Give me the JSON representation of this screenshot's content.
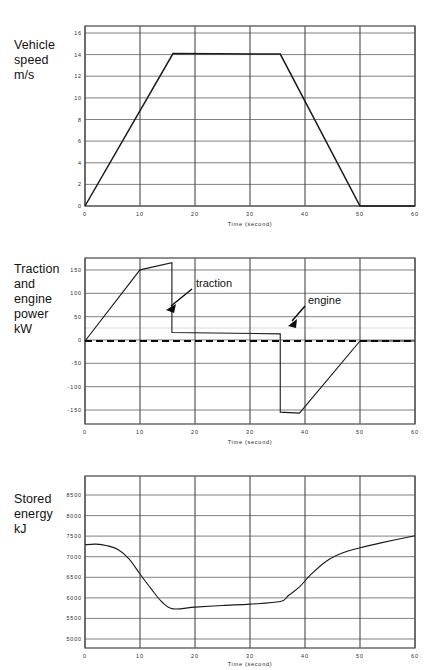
{
  "page": {
    "background": "#ffffff",
    "figure_count": 3
  },
  "chart_data": [
    {
      "type": "line",
      "id": "vehicle-speed",
      "title": "",
      "ylabel": "Vehicle\nspeed\nm/s",
      "xlabel": "Time (second)",
      "xlim": [
        0,
        60
      ],
      "ylim": [
        0,
        16
      ],
      "xticks": [
        "0",
        "10",
        "20",
        "30",
        "40",
        "50",
        "60"
      ],
      "xtick_values": [
        0,
        10,
        20,
        30,
        40,
        50,
        60
      ],
      "yticks": [
        "0",
        "2",
        "4",
        "6",
        "8",
        "10",
        "12",
        "14",
        "16"
      ],
      "ytick_values": [
        0,
        2,
        4,
        6,
        8,
        10,
        12,
        14,
        16
      ],
      "grid": true,
      "legend": null,
      "series": [
        {
          "name": "vehicle speed",
          "color": "#1a1a1a",
          "x": [
            0,
            16,
            35.5,
            50,
            60
          ],
          "y": [
            0,
            14.1,
            14.05,
            0,
            0
          ]
        }
      ]
    },
    {
      "type": "line",
      "id": "traction-and-engine-power",
      "title": "",
      "ylabel": "Traction\nand\nengine\npower\nkW",
      "xlabel": "Time (second)",
      "xlim": [
        0,
        60
      ],
      "ylim": [
        -175,
        175
      ],
      "xticks": [
        "0",
        "10",
        "20",
        "30",
        "40",
        "50",
        "60"
      ],
      "xtick_values": [
        0,
        10,
        20,
        30,
        40,
        50,
        60
      ],
      "yticks": [
        "150",
        "100",
        "50",
        "0",
        "-50",
        "-100",
        "-150"
      ],
      "ytick_values": [
        150,
        100,
        50,
        0,
        -50,
        -100,
        -150
      ],
      "grid": true,
      "annotations": [
        {
          "text": "traction",
          "x_text": 23.5,
          "y_text": 140,
          "x_point": 15.8,
          "y_point": 72
        },
        {
          "text": "engine",
          "x_text": 44.0,
          "y_text": 62,
          "x_point": 39.2,
          "y_point": 15
        }
      ],
      "series": [
        {
          "name": "traction",
          "color": "#1a1a1a",
          "x": [
            0,
            10,
            15.8,
            15.8,
            35.5,
            35.5,
            39.0,
            50.0,
            60.0
          ],
          "y": [
            0,
            150,
            165,
            18,
            15,
            -150,
            -152,
            0,
            0
          ]
        },
        {
          "name": "engine",
          "color": "#0a0a0a",
          "style": "dashed",
          "x": [
            0,
            60
          ],
          "y": [
            0,
            0
          ]
        }
      ]
    },
    {
      "type": "line",
      "id": "stored-energy",
      "title": "",
      "ylabel": "Stored\nenergy\nkJ",
      "xlabel": "Time (second)",
      "xlim": [
        0,
        60
      ],
      "ylim": [
        4800,
        8800
      ],
      "xticks": [
        "0",
        "10",
        "20",
        "30",
        "40",
        "50",
        "60"
      ],
      "xtick_values": [
        0,
        10,
        20,
        30,
        40,
        50,
        60
      ],
      "yticks": [
        "8500",
        "8000",
        "7500",
        "7000",
        "6500",
        "6000",
        "5500",
        "5000"
      ],
      "ytick_values": [
        8500,
        8000,
        7500,
        7000,
        6500,
        6000,
        5500,
        5000
      ],
      "grid": true,
      "legend": null,
      "series": [
        {
          "name": "stored energy",
          "color": "#1a1a1a",
          "x": [
            0,
            2,
            4,
            6,
            8,
            10,
            12,
            14,
            16,
            20,
            25,
            30,
            35.5,
            37,
            39,
            41,
            44,
            47,
            50,
            54,
            60
          ],
          "y": [
            7200,
            7215,
            7180,
            7090,
            6870,
            6520,
            6180,
            5870,
            5710,
            5750,
            5790,
            5820,
            5880,
            6020,
            6220,
            6500,
            6830,
            7020,
            7130,
            7250,
            7410
          ]
        }
      ]
    }
  ]
}
